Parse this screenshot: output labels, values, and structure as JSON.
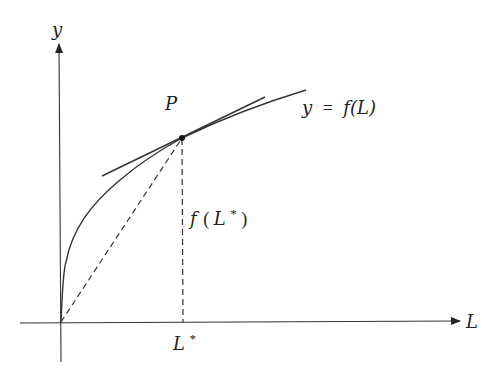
{
  "top_cropped_text": "f (L*)/L*, ...",
  "axes": {
    "x_label": "L",
    "y_label": "y"
  },
  "curve": {
    "label": "y = f(L)",
    "label_parts": {
      "lhs": "y",
      "eq": "=",
      "rhs": "f(L)"
    }
  },
  "point": {
    "label": "P"
  },
  "annotations": {
    "height_label": "f(L*)",
    "height_label_parts": {
      "f": "f",
      "open": "(",
      "L": "L",
      "star": "*",
      "close": ")"
    },
    "x_tick_label": "L*",
    "x_tick_parts": {
      "L": "L",
      "star": "*"
    }
  },
  "colors": {
    "line": "#333333",
    "background": "#ffffff"
  }
}
